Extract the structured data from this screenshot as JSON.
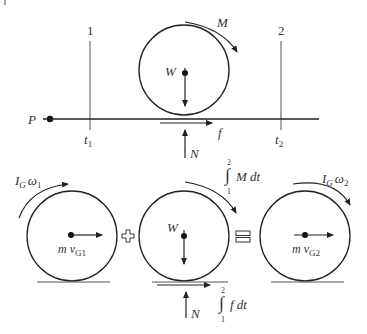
{
  "figure": {
    "corner_mark": "|",
    "top": {
      "marker_1": "1",
      "marker_2": "2",
      "time_1": "t",
      "time_1_sub": "1",
      "time_2": "t",
      "time_2_sub": "2",
      "point_label": "P",
      "weight_label": "W",
      "moment_label": "M",
      "friction_label": "f",
      "normal_label": "N"
    },
    "bottom": {
      "left": {
        "angular_momentum": "I",
        "angular_momentum_sub": "G",
        "omega": "ω",
        "omega_sub": "1",
        "linear_momentum": "m v",
        "linear_momentum_sub": "G1"
      },
      "middle": {
        "weight_label": "W",
        "moment_impulse": "M dt",
        "friction_impulse": "f dt",
        "normal_label": "N",
        "integral_upper": "2",
        "integral_lower": "1"
      },
      "right": {
        "angular_momentum": "I",
        "angular_momentum_sub": "G",
        "omega": "ω",
        "omega_sub": "2",
        "linear_momentum": "m v",
        "linear_momentum_sub": "G2"
      },
      "plus_symbol": "+",
      "equals_symbol": "="
    }
  }
}
